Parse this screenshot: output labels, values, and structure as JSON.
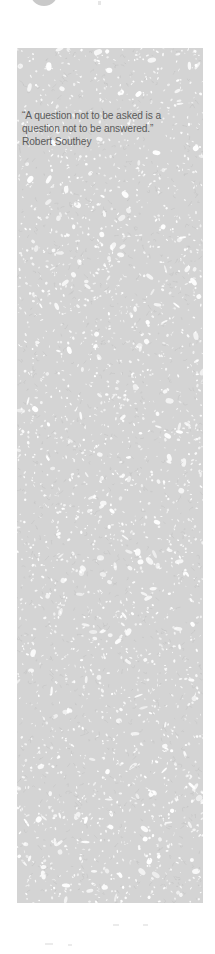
{
  "quote": {
    "text_line1": "“A question not to be asked is a",
    "text_line2": "question not to be answered.”",
    "author": "Robert Southey"
  },
  "colors": {
    "panel_texture": "#d4d4d4",
    "quote_text": "#5a5a5a",
    "circle": "#c9c9c9",
    "background": "#ffffff"
  },
  "icons": {
    "top_circle": "circle-avatar-icon"
  }
}
